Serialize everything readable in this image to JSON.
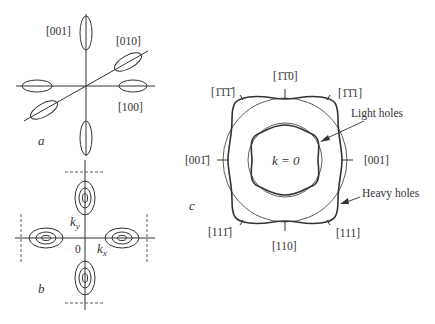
{
  "panels": {
    "a": {
      "label": "a",
      "directions": [
        "[001]",
        "[010]",
        "[100]"
      ]
    },
    "b": {
      "label": "b",
      "origin": "0",
      "axis_x": "k",
      "axis_x_sub": "x",
      "axis_y": "k",
      "axis_y_sub": "y"
    },
    "c": {
      "label": "c",
      "center": "k = 0",
      "light_holes": "Light holes",
      "heavy_holes": "Heavy holes",
      "directions": {
        "top": "[1̄1̄0]",
        "top_left": "[1̄1̄1̄]",
        "top_right": "[1̄1̄1]",
        "left": "[001̄]",
        "right": "[001]",
        "bottom_left": "[111̄]",
        "bottom": "[110]",
        "bottom_right": "[111]"
      }
    }
  },
  "colors": {
    "line": "#333333",
    "background": "#ffffff"
  }
}
